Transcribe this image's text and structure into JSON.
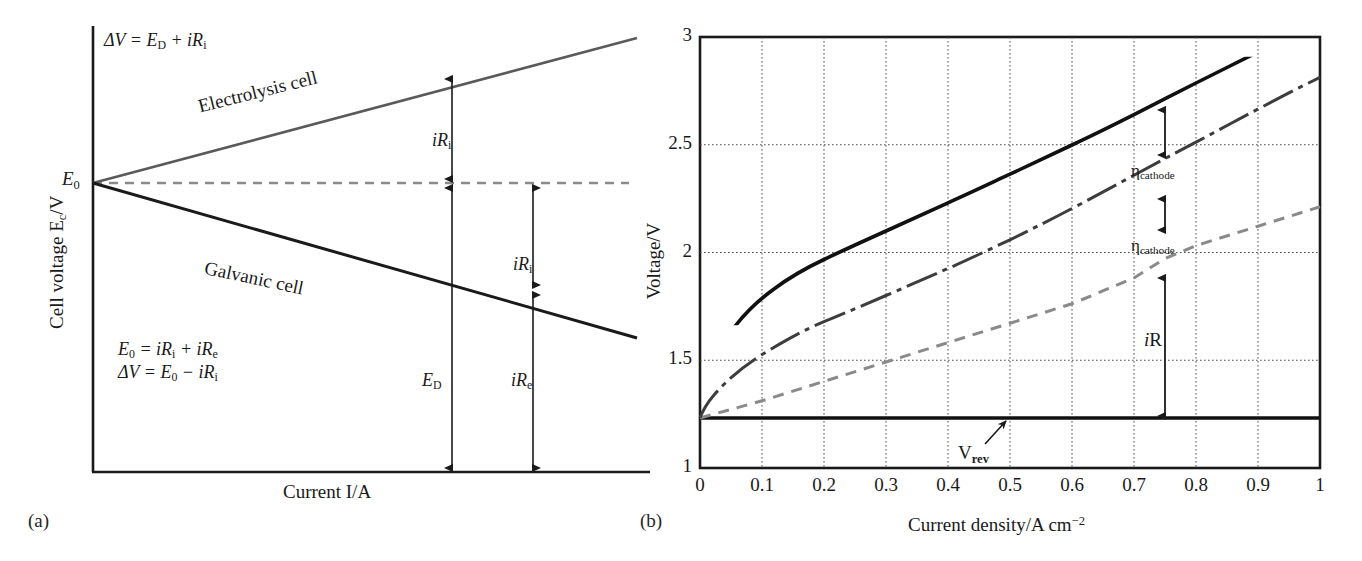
{
  "figure": {
    "panel_a_label": "(a)",
    "panel_b_label": "(b)"
  },
  "panel_a": {
    "ylabel_prefix": "Cell voltage E",
    "ylabel_sub": "c",
    "ylabel_suffix": "/V",
    "xlabel": "Current I/A",
    "origin_label": "E",
    "origin_sub": "0",
    "eq_top": {
      "lhs": "ΔV = E",
      "lhs_sub": "D",
      "rhs": " + iR",
      "rhs_sub": "i"
    },
    "eq_b1": {
      "a": "E",
      "a_sub": "0",
      "b": " = iR",
      "b_sub": "i",
      "c": " + iR",
      "c_sub": "e"
    },
    "eq_b2": {
      "a": "ΔV = E",
      "a_sub": "0",
      "b": " − iR",
      "b_sub": "i"
    },
    "curve_electrolysis_label": "Electrolysis cell",
    "curve_galvanic_label": "Galvanic cell",
    "annot_iri_top": {
      "text": "iR",
      "sub": "i"
    },
    "annot_iri_mid": {
      "text": "iR",
      "sub": "i"
    },
    "annot_ed": {
      "text": "E",
      "sub": "D"
    },
    "annot_ire": {
      "text": "iR",
      "sub": "e"
    },
    "colors": {
      "axis": "#1a1a1a",
      "electrolysis_line": "#555555",
      "galvanic_line": "#1a1a1a",
      "dashed_reference": "#8a8a8a"
    },
    "chart_data": {
      "type": "line",
      "title": "",
      "xlabel": "Current I/A",
      "ylabel": "Cell voltage E_c/V",
      "xlim": [
        0,
        1
      ],
      "ylim": [
        0,
        1
      ],
      "grid": false,
      "axis_ticks": false,
      "series": [
        {
          "name": "Electrolysis cell",
          "style": "solid-gray",
          "x": [
            0,
            1
          ],
          "y": [
            0.655,
            0.975
          ]
        },
        {
          "name": "E0 reference (equilibrium)",
          "style": "dashed",
          "x": [
            0,
            1
          ],
          "y": [
            0.655,
            0.655
          ]
        },
        {
          "name": "Galvanic cell",
          "style": "solid-black",
          "x": [
            0,
            1
          ],
          "y": [
            0.655,
            0.305
          ]
        }
      ],
      "annotations": [
        {
          "label": "iR_i",
          "type": "double-arrow",
          "x": 0.72,
          "y_from": 0.655,
          "y_to": 0.845
        },
        {
          "label": "iR_i",
          "type": "double-arrow",
          "x": 0.865,
          "y_from": 0.455,
          "y_to": 0.655
        },
        {
          "label": "E_D",
          "type": "double-arrow",
          "x": 0.72,
          "y_from": 0.0,
          "y_to": 0.655
        },
        {
          "label": "iR_e",
          "type": "double-arrow",
          "x": 0.865,
          "y_from": 0.0,
          "y_to": 0.455
        }
      ]
    }
  },
  "panel_b": {
    "ylabel": "Voltage/V",
    "xlabel_prefix": "Current density/A cm",
    "xlabel_sup": "−2",
    "yticks": [
      "1",
      "1.5",
      "2",
      "2.5",
      "3"
    ],
    "xticks": [
      "0",
      "0.1",
      "0.2",
      "0.3",
      "0.4",
      "0.5",
      "0.6",
      "0.7",
      "0.8",
      "0.9",
      "1"
    ],
    "annot_eta_upper": {
      "text": "η",
      "sub": "cathode"
    },
    "annot_eta_lower": {
      "text": "η",
      "sub": "cathode"
    },
    "annot_iR": {
      "text": "i",
      "rest": "R"
    },
    "annot_vrev": {
      "text": "V",
      "sub": "rev"
    },
    "colors": {
      "frame": "#1a1a1a",
      "grid": "#4d4d4d",
      "total_curve": "#111111",
      "dashdot_curve": "#3d3d3d",
      "dashed_curve": "#8a8a8a",
      "vrev_line": "#111111"
    },
    "chart_data": {
      "type": "line",
      "title": "",
      "xlabel": "Current density/A cm−2",
      "ylabel": "Voltage/V",
      "xlim": [
        0,
        1
      ],
      "ylim": [
        1,
        3
      ],
      "yticks": [
        1,
        1.5,
        2,
        2.5,
        3
      ],
      "xticks": [
        0,
        0.1,
        0.2,
        0.3,
        0.4,
        0.5,
        0.6,
        0.7,
        0.8,
        0.9,
        1
      ],
      "grid": true,
      "legend": "none",
      "series": [
        {
          "name": "Total cell voltage",
          "style": "solid",
          "x": [
            0,
            0.02,
            0.05,
            0.1,
            0.15,
            0.2,
            0.25,
            0.3,
            0.35,
            0.4,
            0.45,
            0.5,
            0.55,
            0.6,
            0.65,
            0.7,
            0.75,
            0.8,
            0.85,
            0.9,
            0.95,
            1.0
          ],
          "y": [
            1.23,
            1.47,
            1.62,
            1.76,
            1.85,
            1.92,
            1.98,
            2.04,
            2.09,
            2.14,
            2.18,
            2.23,
            2.28,
            2.33,
            2.38,
            2.44,
            2.5,
            2.56,
            2.62,
            2.68,
            2.74,
            2.8
          ]
        },
        {
          "name": "V_rev + η_cathode",
          "style": "dash-dot",
          "x": [
            0,
            0.02,
            0.05,
            0.1,
            0.15,
            0.2,
            0.25,
            0.3,
            0.35,
            0.4,
            0.45,
            0.5,
            0.55,
            0.6,
            0.65,
            0.7,
            0.75,
            0.8,
            0.85,
            0.9,
            0.95,
            1.0
          ],
          "y": [
            1.23,
            1.33,
            1.4,
            1.47,
            1.52,
            1.57,
            1.62,
            1.67,
            1.72,
            1.77,
            1.82,
            1.88,
            1.94,
            2.0,
            2.07,
            2.13,
            2.2,
            2.25,
            2.31,
            2.36,
            2.41,
            2.46
          ]
        },
        {
          "name": "V_rev + iR",
          "style": "dashed",
          "x": [
            0,
            0.1,
            0.2,
            0.3,
            0.4,
            0.5,
            0.6,
            0.7,
            0.75,
            0.8,
            0.9,
            1.0
          ],
          "y": [
            1.23,
            1.31,
            1.4,
            1.49,
            1.58,
            1.67,
            1.76,
            1.88,
            1.97,
            2.03,
            2.12,
            2.21
          ]
        },
        {
          "name": "V_rev",
          "style": "solid-thick",
          "x": [
            0,
            1.0
          ],
          "y": [
            1.23,
            1.23
          ]
        }
      ],
      "annotations": [
        {
          "label": "η_cathode",
          "type": "double-arrow",
          "x": 0.75,
          "y_from": 2.2,
          "y_to": 2.5
        },
        {
          "label": "η_cathode",
          "type": "double-arrow",
          "x": 0.75,
          "y_from": 1.97,
          "y_to": 2.2
        },
        {
          "label": "iR",
          "type": "double-arrow",
          "x": 0.75,
          "y_from": 1.23,
          "y_to": 1.97
        },
        {
          "label": "V_rev",
          "type": "pointer-arrow",
          "x": 0.49,
          "y": 1.23
        }
      ]
    }
  }
}
